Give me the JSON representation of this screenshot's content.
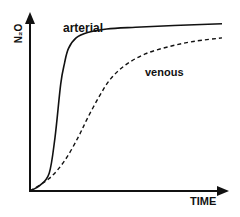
{
  "chart_data": {
    "type": "line",
    "title": "",
    "xlabel": "TIME",
    "ylabel": "N2O",
    "ylabel_display": "N₂O",
    "grid": false,
    "legend": "none (inline curve labels)",
    "x_ticks": [],
    "y_ticks": [],
    "x_range": [
      0,
      1
    ],
    "y_range": [
      0,
      1
    ],
    "series": [
      {
        "name": "arterial",
        "style": "solid",
        "x": [
          0.0,
          0.05,
          0.1,
          0.13,
          0.16,
          0.18,
          0.2,
          0.24,
          0.3,
          0.4,
          0.55,
          0.75,
          1.0
        ],
        "values": [
          0.0,
          0.03,
          0.1,
          0.3,
          0.6,
          0.72,
          0.8,
          0.86,
          0.89,
          0.91,
          0.92,
          0.93,
          0.94
        ]
      },
      {
        "name": "venous",
        "style": "dashed",
        "x": [
          0.0,
          0.1,
          0.18,
          0.25,
          0.3,
          0.36,
          0.42,
          0.5,
          0.6,
          0.72,
          0.85,
          1.0
        ],
        "values": [
          0.0,
          0.07,
          0.17,
          0.3,
          0.41,
          0.53,
          0.63,
          0.71,
          0.77,
          0.81,
          0.84,
          0.86
        ]
      }
    ],
    "annotations": [
      "arterial",
      "venous"
    ]
  },
  "labels": {
    "arterial": "arterial",
    "venous": "venous",
    "xaxis": "TIME",
    "yaxis": "N₂O"
  },
  "colors": {
    "line": "#111111",
    "background": "#ffffff"
  }
}
